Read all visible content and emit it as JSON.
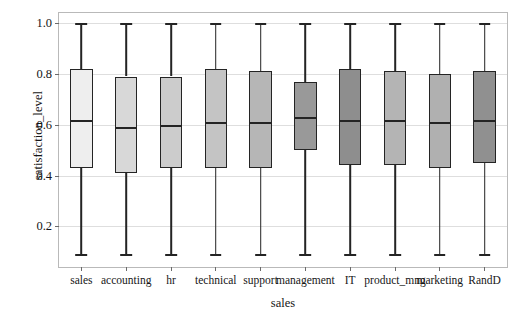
{
  "chart_data": {
    "type": "box",
    "title": "",
    "xlabel": "sales",
    "ylabel": "satisfaction_level",
    "ylim": [
      0.04,
      1.04
    ],
    "yticks": [
      0.2,
      0.4,
      0.6,
      0.8,
      1.0
    ],
    "ytick_labels": [
      "0.2",
      "0.4",
      "0.6",
      "0.8",
      "1.0"
    ],
    "grid": true,
    "legend": "none",
    "categories": [
      "sales",
      "accounting",
      "hr",
      "technical",
      "support",
      "management",
      "IT",
      "product_mng",
      "marketing",
      "RandD"
    ],
    "boxes": [
      {
        "category": "sales",
        "whisker_low": 0.09,
        "q1": 0.43,
        "median": 0.62,
        "q3": 0.82,
        "whisker_high": 1.0,
        "fill": "#eeeeee"
      },
      {
        "category": "accounting",
        "whisker_low": 0.09,
        "q1": 0.41,
        "median": 0.59,
        "q3": 0.79,
        "whisker_high": 1.0,
        "fill": "#d8d8d8"
      },
      {
        "category": "hr",
        "whisker_low": 0.09,
        "q1": 0.43,
        "median": 0.6,
        "q3": 0.79,
        "whisker_high": 1.0,
        "fill": "#cccccc"
      },
      {
        "category": "technical",
        "whisker_low": 0.09,
        "q1": 0.43,
        "median": 0.61,
        "q3": 0.82,
        "whisker_high": 1.0,
        "fill": "#c4c4c4"
      },
      {
        "category": "support",
        "whisker_low": 0.09,
        "q1": 0.43,
        "median": 0.61,
        "q3": 0.81,
        "whisker_high": 1.0,
        "fill": "#b6b6b6"
      },
      {
        "category": "management",
        "whisker_low": 0.09,
        "q1": 0.5,
        "median": 0.63,
        "q3": 0.77,
        "whisker_high": 1.0,
        "fill": "#999999"
      },
      {
        "category": "IT",
        "whisker_low": 0.09,
        "q1": 0.44,
        "median": 0.62,
        "q3": 0.82,
        "whisker_high": 1.0,
        "fill": "#8e8e8e"
      },
      {
        "category": "product_mng",
        "whisker_low": 0.09,
        "q1": 0.44,
        "median": 0.62,
        "q3": 0.81,
        "whisker_high": 1.0,
        "fill": "#b4b4b4"
      },
      {
        "category": "marketing",
        "whisker_low": 0.09,
        "q1": 0.43,
        "median": 0.61,
        "q3": 0.8,
        "whisker_high": 1.0,
        "fill": "#b0b0b0"
      },
      {
        "category": "RandD",
        "whisker_low": 0.09,
        "q1": 0.45,
        "median": 0.62,
        "q3": 0.81,
        "whisker_high": 1.0,
        "fill": "#909090"
      }
    ],
    "colors": {
      "axis_line": "#b9b9b9",
      "gridline": "#dedede",
      "box_edge": "#242424",
      "text": "#161616",
      "background": "#ffffff"
    }
  }
}
